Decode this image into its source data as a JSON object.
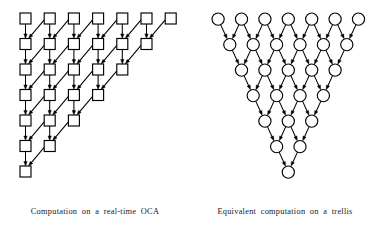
{
  "figure": {
    "background_color": "#ffffff",
    "stroke_color": "#000000",
    "node_fill_color": "#ffffff"
  },
  "panels": [
    {
      "id": "oca",
      "caption": "Computation on a real-time OCA",
      "node_shape": "square",
      "node_size": 11,
      "col_spacing": 24.2,
      "row_spacing": 25.5,
      "origin_x": 20,
      "origin_y": 13,
      "rows": [
        7,
        6,
        5,
        4,
        3,
        2,
        1
      ],
      "edges": [
        "vertical-down",
        "diagonal-down-left"
      ]
    },
    {
      "id": "trellis",
      "caption": "Equivalent computation on a trellis",
      "node_shape": "circle",
      "node_radius": 6.1,
      "col_spacing": 23.4,
      "row_spacing": 25.5,
      "origin_x": 22,
      "origin_y": 13,
      "rows": [
        7,
        6,
        5,
        4,
        3,
        2,
        1
      ],
      "edges": [
        "diagonal-down-left",
        "diagonal-down-right"
      ]
    }
  ]
}
